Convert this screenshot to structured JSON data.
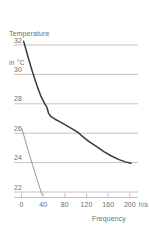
{
  "chart_data": {
    "type": "line",
    "title": "",
    "ylabel": "Temperature\nin °C",
    "ylabel_line1": "Temperature",
    "ylabel_line2": "in °C",
    "xlabel": "Frequency",
    "xunit": "h/a",
    "xlim": [
      0,
      215
    ],
    "ylim": [
      21.3,
      32.6
    ],
    "xticks": [
      0,
      40,
      80,
      120,
      160,
      200
    ],
    "xtick_labels": [
      "0",
      "40",
      "80",
      "120",
      "160",
      "200"
    ],
    "yticks": [
      32,
      30,
      28,
      26,
      24,
      22
    ],
    "ytick_labels": [
      "32",
      "30",
      "28",
      "26",
      "24",
      "22"
    ],
    "grid": true,
    "grid_color": "#b4b4b4",
    "legend": "none",
    "series": [
      {
        "name": "main-curve",
        "color": "#3a3a3a",
        "width": 1.5,
        "points": [
          [
            4,
            32.25
          ],
          [
            12,
            31.2
          ],
          [
            20,
            30.2
          ],
          [
            28,
            29.3
          ],
          [
            36,
            28.5
          ],
          [
            43,
            28.0
          ],
          [
            47,
            27.75
          ],
          [
            50,
            27.35
          ],
          [
            54,
            27.15
          ],
          [
            62,
            26.95
          ],
          [
            72,
            26.75
          ],
          [
            84,
            26.5
          ],
          [
            96,
            26.25
          ],
          [
            106,
            26.0
          ],
          [
            112,
            25.8
          ],
          [
            124,
            25.45
          ],
          [
            138,
            25.1
          ],
          [
            152,
            24.75
          ],
          [
            166,
            24.45
          ],
          [
            180,
            24.2
          ],
          [
            192,
            24.05
          ],
          [
            202,
            23.95
          ]
        ]
      },
      {
        "name": "secondary-curve",
        "color": "#9a9a9a",
        "width": 1.0,
        "points": [
          [
            1,
            26.3
          ],
          [
            10,
            25.1
          ],
          [
            20,
            23.9
          ],
          [
            30,
            22.7
          ],
          [
            38,
            21.8
          ]
        ]
      }
    ]
  }
}
